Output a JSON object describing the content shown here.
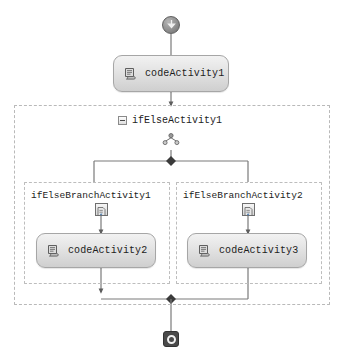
{
  "diagram": {
    "type": "workflow-designer",
    "colors": {
      "activity_border": "#a6a6a6",
      "activity_fill_top": "#f2f2f2",
      "activity_fill_bottom": "#cfcfcf",
      "connector": "#7a7a7a",
      "container_border": "#b9b9b9",
      "end_node_fill": "#4a4a4a",
      "text": "#1c1c1c"
    }
  },
  "nodes": {
    "start": {
      "name": "start-node",
      "icon": "down-arrow-circle-icon"
    },
    "code_activity_1": {
      "label": "codeActivity1",
      "icon": "code-activity-icon"
    },
    "ifelse_activity": {
      "label": "ifElseActivity1",
      "expander": "collapse-minus-icon",
      "icon": "if-else-decision-icon"
    },
    "branch_1": {
      "label": "ifElseBranchActivity1",
      "icon": "branch-condition-icon"
    },
    "branch_2": {
      "label": "ifElseBranchActivity2",
      "icon": "branch-condition-icon"
    },
    "code_activity_2": {
      "label": "codeActivity2",
      "icon": "code-activity-icon"
    },
    "code_activity_3": {
      "label": "codeActivity3",
      "icon": "code-activity-icon"
    },
    "end": {
      "name": "end-node",
      "icon": "stop-circle-icon"
    }
  }
}
